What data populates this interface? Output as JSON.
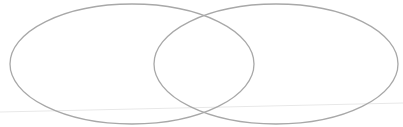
{
  "diagram": {
    "type": "venn",
    "sets": [
      {
        "name": "left-set",
        "label": "",
        "cx": 132,
        "cy": 64,
        "rx": 122,
        "ry": 60
      },
      {
        "name": "right-set",
        "label": "",
        "cx": 276,
        "cy": 64,
        "rx": 122,
        "ry": 60
      }
    ],
    "stroke_color": "#a8a8a8",
    "guide_line_color": "#e6e6e6"
  }
}
